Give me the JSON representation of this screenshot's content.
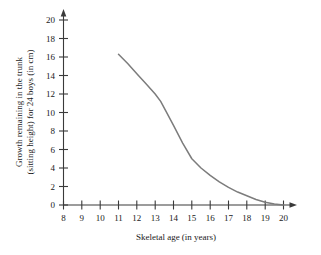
{
  "chart_data": {
    "type": "line",
    "title": "",
    "xlabel": "Skeletal age (in years)",
    "ylabel": "Growth remaining in the trunk (sitting height) for 24 boys (in cm)",
    "ylabel_line1": "Growth remaining in the trunk",
    "ylabel_line2": "(sitting height) for 24 boys (in cm)",
    "xlim": [
      8,
      20
    ],
    "ylim": [
      0,
      20
    ],
    "xticks": [
      8,
      9,
      10,
      11,
      12,
      13,
      14,
      15,
      16,
      17,
      18,
      19,
      20
    ],
    "yticks": [
      0,
      2,
      4,
      6,
      8,
      10,
      12,
      14,
      16,
      18,
      20
    ],
    "xtick_labels": [
      "8",
      "9",
      "10",
      "11",
      "12",
      "13",
      "14",
      "15",
      "16",
      "17",
      "18",
      "19",
      "20"
    ],
    "ytick_labels": [
      "0",
      "2",
      "4",
      "6",
      "8",
      "10",
      "12",
      "14",
      "16",
      "18",
      "20"
    ],
    "grid": false,
    "legend": "none",
    "series": [
      {
        "name": "Growth remaining in the trunk",
        "color": "#7c7c7c",
        "x": [
          11.0,
          11.5,
          12.0,
          12.5,
          13.0,
          13.3,
          13.6,
          14.0,
          14.5,
          15.0,
          15.5,
          16.0,
          16.5,
          17.0,
          17.5,
          18.0,
          18.5,
          19.0,
          19.5,
          20.0
        ],
        "values": [
          16.3,
          15.3,
          14.2,
          13.1,
          12.0,
          11.2,
          10.1,
          8.6,
          6.7,
          5.0,
          4.0,
          3.2,
          2.5,
          1.9,
          1.4,
          1.0,
          0.6,
          0.3,
          0.1,
          0.0
        ]
      }
    ],
    "annotations": []
  },
  "colors": {
    "axis": "#3a3a3a",
    "curve": "#7c7c7c",
    "background": "#ffffff",
    "text": "#1a1a1a"
  }
}
